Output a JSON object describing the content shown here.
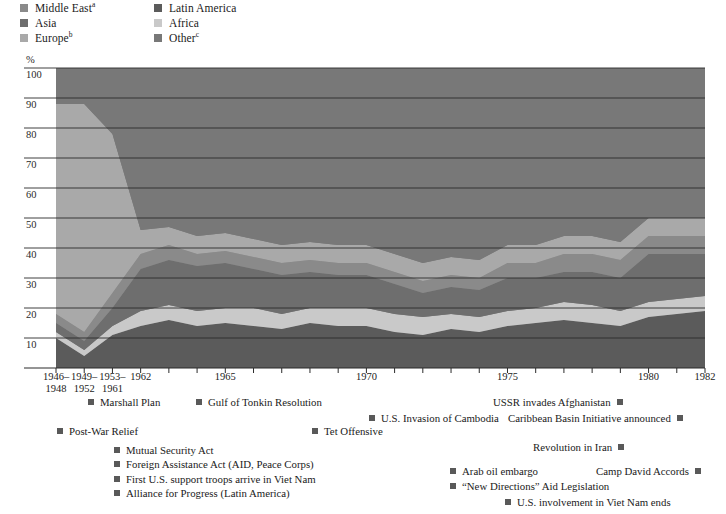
{
  "legend": {
    "columns": [
      {
        "items": [
          {
            "label": "Middle East",
            "sup": "a",
            "color": "#8a8a8a",
            "name": "legend-item-middle-east"
          },
          {
            "label": "Asia",
            "sup": "",
            "color": "#6e6e6e",
            "name": "legend-item-asia"
          },
          {
            "label": "Europe",
            "sup": "b",
            "color": "#a9a9a9",
            "name": "legend-item-europe"
          }
        ]
      },
      {
        "items": [
          {
            "label": "Latin America",
            "sup": "",
            "color": "#5b5b5b",
            "name": "legend-item-latin-america"
          },
          {
            "label": "Africa",
            "sup": "",
            "color": "#c9c9c9",
            "name": "legend-item-africa"
          },
          {
            "label": "Other",
            "sup": "c",
            "color": "#787878",
            "name": "legend-item-other"
          }
        ]
      }
    ]
  },
  "axes": {
    "y_unit": "%",
    "y_ticks": [
      "100",
      "90",
      "80",
      "70",
      "60",
      "50",
      "40",
      "30",
      "20",
      "10"
    ],
    "x_ticks": [
      {
        "line1": "1946–",
        "line2": "1948"
      },
      {
        "line1": "1949–",
        "line2": "1952"
      },
      {
        "line1": "1953–",
        "line2": "1961"
      },
      {
        "line1": "1962",
        "line2": ""
      },
      {
        "line1": "1965",
        "line2": ""
      },
      {
        "line1": "1970",
        "line2": ""
      },
      {
        "line1": "1975",
        "line2": ""
      },
      {
        "line1": "1980",
        "line2": ""
      },
      {
        "line1": "1982",
        "line2": ""
      }
    ]
  },
  "events": [
    {
      "label": "Marshall Plan",
      "marker": "left",
      "x": 88,
      "y": 0
    },
    {
      "label": "Gulf of Tonkin Resolution",
      "marker": "left",
      "x": 196,
      "y": 0
    },
    {
      "label": "USSR invades Afghanistan",
      "marker": "right",
      "x": 493,
      "y": 0
    },
    {
      "label": "U.S. Invasion of Cambodia",
      "marker": "left",
      "x": 369,
      "y": 16
    },
    {
      "label": "Caribbean Basin Initiative announced",
      "marker": "right",
      "x": 508,
      "y": 16
    },
    {
      "label": "Post-War Relief",
      "marker": "left",
      "x": 57,
      "y": 29
    },
    {
      "label": "Tet Offensive",
      "marker": "left",
      "x": 312,
      "y": 29
    },
    {
      "label": "Revolution in Iran",
      "marker": "right",
      "x": 533,
      "y": 45
    },
    {
      "label": "Mutual Security Act",
      "marker": "left",
      "x": 114,
      "y": 48
    },
    {
      "label": "Foreign Assistance Act (AID, Peace Corps)",
      "marker": "left",
      "x": 114,
      "y": 62
    },
    {
      "label": "Arab oil embargo",
      "marker": "left",
      "x": 450,
      "y": 69
    },
    {
      "label": "Camp David Accords",
      "marker": "right",
      "x": 596,
      "y": 69
    },
    {
      "label": "First U.S. support troops arrive in Viet Nam",
      "marker": "left",
      "x": 114,
      "y": 77
    },
    {
      "label": "“New Directions” Aid Legislation",
      "marker": "left",
      "x": 450,
      "y": 84
    },
    {
      "label": "Alliance for Progress (Latin America)",
      "marker": "left",
      "x": 114,
      "y": 91
    },
    {
      "label": "U.S. involvement in Viet Nam ends",
      "marker": "left",
      "x": 505,
      "y": 100
    }
  ],
  "chart_data": {
    "type": "area",
    "title": "",
    "xlabel": "",
    "ylabel": "%",
    "ylim": [
      0,
      100
    ],
    "grid": true,
    "stacked": true,
    "legend_position": "top-left",
    "x": [
      "1946-1948",
      "1949-1952",
      "1953-1961",
      "1962",
      "1963",
      "1964",
      "1965",
      "1966",
      "1967",
      "1968",
      "1969",
      "1970",
      "1971",
      "1972",
      "1973",
      "1974",
      "1975",
      "1976",
      "1977",
      "1978",
      "1979",
      "1980",
      "1981",
      "1982"
    ],
    "categories": [
      "1946-1948",
      "1949-1952",
      "1953-1961",
      "1962",
      "1963",
      "1964",
      "1965",
      "1966",
      "1967",
      "1968",
      "1969",
      "1970",
      "1971",
      "1972",
      "1973",
      "1974",
      "1975",
      "1976",
      "1977",
      "1978",
      "1979",
      "1980",
      "1981",
      "1982"
    ],
    "series": [
      {
        "name": "Latin America",
        "color": "#5b5b5b",
        "values": [
          10,
          4,
          11,
          14,
          16,
          14,
          15,
          14,
          13,
          15,
          14,
          14,
          12,
          11,
          13,
          12,
          14,
          15,
          16,
          15,
          14,
          17,
          18,
          19
        ]
      },
      {
        "name": "Africa",
        "color": "#c9c9c9",
        "values": [
          2,
          2,
          3,
          5,
          5,
          5,
          5,
          6,
          5,
          5,
          6,
          6,
          6,
          6,
          5,
          5,
          5,
          5,
          6,
          6,
          5,
          5,
          5,
          5
        ]
      },
      {
        "name": "Asia",
        "color": "#6e6e6e",
        "values": [
          3,
          3,
          6,
          14,
          15,
          15,
          15,
          13,
          13,
          12,
          11,
          11,
          10,
          8,
          9,
          9,
          11,
          10,
          10,
          11,
          11,
          16,
          15,
          14
        ]
      },
      {
        "name": "Middle East",
        "color": "#8a8a8a",
        "values": [
          3,
          3,
          5,
          5,
          5,
          4,
          4,
          4,
          4,
          4,
          4,
          4,
          4,
          4,
          4,
          4,
          5,
          5,
          6,
          6,
          6,
          6,
          6,
          6
        ]
      },
      {
        "name": "Europe",
        "color": "#a9a9a9",
        "values": [
          70,
          76,
          53,
          8,
          6,
          6,
          6,
          6,
          6,
          6,
          6,
          6,
          6,
          6,
          6,
          6,
          6,
          6,
          6,
          6,
          6,
          6,
          6,
          6
        ]
      },
      {
        "name": "Other",
        "color": "#787878",
        "values": [
          12,
          12,
          22,
          54,
          53,
          56,
          55,
          57,
          59,
          58,
          59,
          59,
          62,
          65,
          63,
          64,
          59,
          59,
          56,
          56,
          58,
          50,
          50,
          50
        ]
      }
    ]
  }
}
